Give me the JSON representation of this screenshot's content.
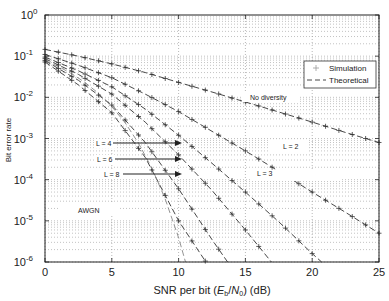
{
  "chart_data": {
    "type": "line",
    "title": "",
    "xlabel": "SNR per bit (E_b/N_0) (dB)",
    "xlabel_parts": {
      "pre": "SNR per bit (",
      "E": "E",
      "b": "b",
      "slash": "/",
      "N": "N",
      "zero": "0",
      "post": ") (dB)"
    },
    "ylabel": "Bit error rate",
    "xlim": [
      0,
      25
    ],
    "ylim": [
      1e-06,
      1
    ],
    "yscale": "log",
    "grid": true,
    "x_ticks": [
      "0",
      "5",
      "10",
      "15",
      "20",
      "25"
    ],
    "y_ticks": [
      {
        "base": "10",
        "exp": "0"
      },
      {
        "base": "10",
        "exp": "-1"
      },
      {
        "base": "10",
        "exp": "-2"
      },
      {
        "base": "10",
        "exp": "-3"
      },
      {
        "base": "10",
        "exp": "-4"
      },
      {
        "base": "10",
        "exp": "-5"
      },
      {
        "base": "10",
        "exp": "-6"
      }
    ],
    "legend": {
      "position": "upper right",
      "entries": [
        {
          "label": "Simulation",
          "style": "plus-marker"
        },
        {
          "label": "Theoretical",
          "style": "dashed-line"
        }
      ]
    },
    "series": [
      {
        "name": "No diversity",
        "x": [
          0,
          2.5,
          5,
          7.5,
          10,
          12.5,
          15,
          17.5,
          20,
          22.5,
          25
        ],
        "values": [
          0.146,
          0.1,
          0.065,
          0.04,
          0.023,
          0.0135,
          0.0077,
          0.0044,
          0.0025,
          0.0014,
          0.0008
        ]
      },
      {
        "name": "L = 2",
        "x": [
          0,
          2.5,
          5,
          7.5,
          10,
          12.5,
          15,
          17.5,
          20,
          22.5,
          25
        ],
        "values": [
          0.11,
          0.06,
          0.03,
          0.012,
          0.0045,
          0.0015,
          0.0005,
          0.00016,
          5e-05,
          1.6e-05,
          5e-06
        ]
      },
      {
        "name": "L = 3",
        "x": [
          0,
          2.5,
          5,
          7.5,
          10,
          12.5,
          15,
          17.5,
          20,
          22.5
        ],
        "values": [
          0.095,
          0.044,
          0.018,
          0.0052,
          0.0012,
          0.00025,
          5e-05,
          9.5e-06,
          1.6e-06,
          3e-07
        ]
      },
      {
        "name": "L = 4",
        "x": [
          0,
          2.5,
          5,
          7.5,
          10,
          12.5,
          15,
          17.5
        ],
        "values": [
          0.087,
          0.036,
          0.012,
          0.0025,
          0.0004,
          5.5e-05,
          6e-06,
          6e-07
        ]
      },
      {
        "name": "L = 6",
        "x": [
          0,
          2.5,
          5,
          7.5,
          10,
          12.5,
          14
        ],
        "values": [
          0.078,
          0.026,
          0.0065,
          0.0008,
          6e-05,
          3.5e-06,
          7e-07
        ]
      },
      {
        "name": "L = 8",
        "x": [
          0,
          2.5,
          5,
          7.5,
          10,
          12.5
        ],
        "values": [
          0.072,
          0.02,
          0.0042,
          0.00035,
          1e-05,
          6e-07
        ]
      },
      {
        "name": "AWGN",
        "x": [
          0,
          1,
          2,
          3,
          4,
          5,
          6,
          7,
          8,
          9,
          10,
          10.6
        ],
        "values": [
          0.079,
          0.056,
          0.0375,
          0.0229,
          0.0125,
          0.006,
          0.0024,
          0.00077,
          0.00019,
          3.4e-05,
          3.9e-06,
          8e-07
        ]
      }
    ],
    "simulation_x": [
      0,
      1,
      2,
      3,
      4,
      5,
      6,
      7,
      8,
      9,
      10,
      11,
      12,
      13,
      14,
      15,
      16,
      17,
      18,
      19,
      20,
      21,
      22,
      23,
      24,
      25
    ],
    "annotations": [
      {
        "text": "No diversity",
        "x": 14.5,
        "y": 0.011
      },
      {
        "text": "L = 2",
        "x": 17.3,
        "y": 0.0009
      },
      {
        "text": "L = 3",
        "x": 17.3,
        "y": 0.00015
      },
      {
        "text": "L = 4",
        "arrow_to_x": 10.4,
        "y": 0.0013
      },
      {
        "text": "L = 6",
        "arrow_to_x": 10.4,
        "y": 0.00055
      },
      {
        "text": "L = 8",
        "arrow_to_x": 10.4,
        "y": 0.00025
      },
      {
        "text": "AWGN",
        "x": 7.5,
        "y": 2.5e-05
      }
    ]
  },
  "labels": {
    "no_div": "No diversity",
    "l2": "L = 2",
    "l3": "L = 3",
    "l4": "L = 4",
    "l6": "L = 6",
    "l8": "L = 8",
    "awgn": "AWGN",
    "legend_sim": "Simulation",
    "legend_theo": "Theoretical"
  },
  "colors": {
    "axis": "#222222",
    "grid": "#9a9a9a",
    "curve": "#333333",
    "curve_light": "#888888"
  }
}
